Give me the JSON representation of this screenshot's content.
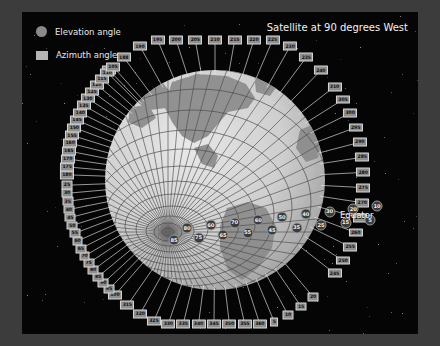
{
  "title": "Satellite at 90 degrees West",
  "legend": {
    "items": [
      {
        "marker": "circle-marker",
        "label": "Elevation angle"
      },
      {
        "marker": "square-marker",
        "label": "Azimuth angle"
      }
    ]
  },
  "annotations": {
    "equator": "Equator"
  },
  "chart_data": {
    "type": "scatter",
    "title": "Satellite at 90 degrees West",
    "subtitle": "",
    "xlabel": "",
    "ylabel": "",
    "projection": "orthographic-globe",
    "grid": true,
    "legend_position": "top-left",
    "globe": {
      "center_px": [
        215,
        180
      ],
      "radius_px": 110,
      "sub_satellite_longitude_deg": -90,
      "sub_satellite_point_px": [
        168,
        232
      ]
    },
    "series": [
      {
        "name": "Azimuth angle",
        "marker": "square",
        "unit": "degrees",
        "step": 5,
        "range": [
          5,
          360
        ],
        "values": [
          5,
          10,
          15,
          20,
          25,
          30,
          35,
          40,
          45,
          50,
          55,
          60,
          65,
          70,
          75,
          80,
          85,
          90,
          95,
          100,
          105,
          110,
          115,
          120,
          125,
          130,
          135,
          140,
          145,
          150,
          155,
          160,
          165,
          170,
          175,
          180,
          185,
          190,
          195,
          200,
          205,
          210,
          215,
          220,
          225,
          230,
          235,
          240,
          245,
          250,
          255,
          260,
          265,
          270,
          275,
          280,
          285,
          290,
          295,
          300,
          305,
          310,
          315,
          320,
          325,
          330,
          335,
          340,
          345,
          350,
          355,
          360
        ]
      },
      {
        "name": "Elevation angle",
        "marker": "circle",
        "unit": "degrees",
        "step": 5,
        "range": [
          5,
          85
        ],
        "values": [
          5,
          10,
          15,
          20,
          25,
          30,
          35,
          40,
          45,
          50,
          55,
          60,
          65,
          70,
          75,
          80,
          85
        ]
      }
    ],
    "azimuth_labels": {
      "top_arc": [
        185,
        188,
        190,
        195,
        200,
        205,
        210,
        215,
        220,
        225,
        230,
        235,
        240
      ],
      "upper_left_arc": [
        180,
        175,
        170,
        165,
        160,
        155,
        150,
        145,
        140,
        135,
        130,
        125,
        120,
        115,
        110,
        105
      ],
      "lower_left_arc": [
        100,
        95,
        90,
        85,
        80,
        75,
        70,
        65,
        60,
        55,
        50,
        45,
        40,
        35,
        30,
        25
      ],
      "bottom_arc": [
        20,
        15,
        10,
        5,
        360,
        355,
        350,
        345,
        340,
        335,
        330,
        325,
        320,
        315
      ],
      "right_arc": [
        310,
        305,
        300,
        295,
        290,
        285,
        280,
        275,
        270,
        265,
        260,
        255,
        250,
        245
      ],
      "equator_marker": 270
    },
    "elevation_labels": {
      "upper_row": [
        80,
        60,
        70,
        60,
        50,
        40,
        30,
        20,
        10
      ],
      "lower_row": [
        85,
        75,
        65,
        55,
        45,
        35,
        25,
        15,
        5
      ]
    }
  }
}
